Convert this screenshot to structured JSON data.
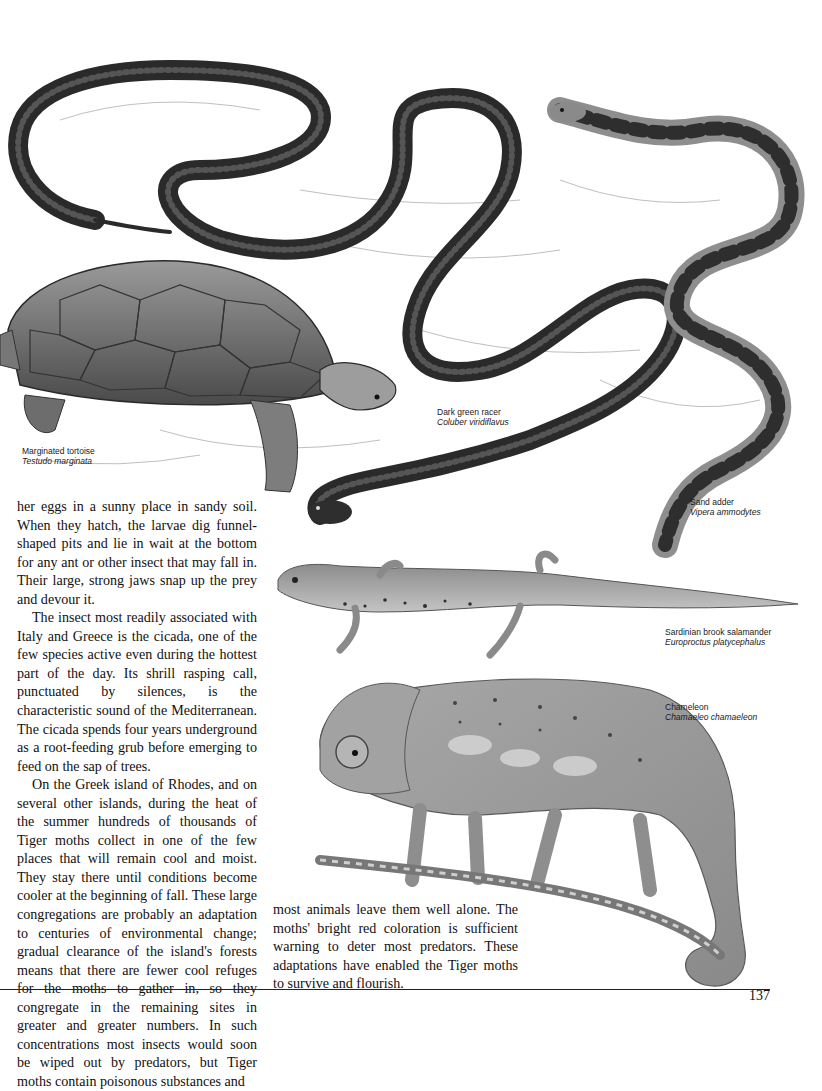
{
  "page": {
    "number": "137"
  },
  "captions": {
    "tortoise": {
      "common": "Marginated tortoise",
      "scientific": "Testudo marginata"
    },
    "racer": {
      "common": "Dark green racer",
      "scientific": "Coluber viridiflavus"
    },
    "adder": {
      "common": "Sand adder",
      "scientific": "Vipera ammodytes"
    },
    "salamander": {
      "common": "Sardinian brook salamander",
      "scientific": "Europroctus platycephalus"
    },
    "chameleon": {
      "common": "Chameleon",
      "scientific": "Chamaeleo chamaeleon"
    }
  },
  "body": {
    "left_column": [
      "her eggs in a sunny place in sandy soil. When they hatch, the larvae dig funnel-shaped pits and lie in wait at the bottom for any ant or other insect that may fall in. Their large, strong jaws snap up the prey and devour it.",
      "The insect most readily associated with Italy and Greece is the cicada, one of the few species active even during the hottest part of the day. Its shrill rasping call, punctuated by silences, is the characteristic sound of the Mediterranean. The cicada spends four years underground as a root-feeding grub before emerging to feed on the sap of trees.",
      "On the Greek island of Rhodes, and on several other islands, during the heat of the summer hundreds of thousands of Tiger moths collect in one of the few places that will remain cool and moist. They stay there until conditions become cooler at the beginning of fall. These large congregations are probably an adaptation to centuries of environmental change; gradual clearance of the island's forests means that there are fewer cool refuges for the moths to gather in, so they congregate in the remaining sites in greater and greater numbers. In such concentrations most insects would soon be wiped out by predators, but Tiger moths contain poisonous substances and"
    ],
    "right_column": [
      "most animals leave them well alone. The moths' bright red coloration is sufficient warning to deter most predators. These adaptations have enabled the Tiger moths to survive and flourish."
    ]
  },
  "colors": {
    "ink": "#111111",
    "illustration_dark": "#2a2a2a",
    "illustration_mid": "#7a7a7a",
    "illustration_light": "#bdbdbd"
  }
}
